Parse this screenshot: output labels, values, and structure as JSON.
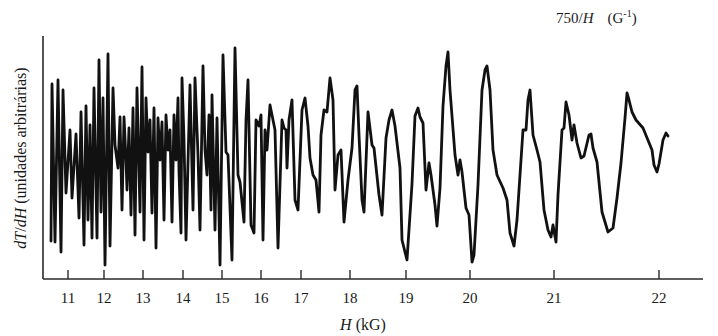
{
  "chart_data": {
    "type": "line",
    "title": "",
    "top_axis_label": {
      "prefix": "750/",
      "var": "H",
      "units": "(G",
      "sup": "-1",
      "close": ")"
    },
    "xlabel": {
      "var": "H",
      "units": " (kG)"
    },
    "ylabel": {
      "num": "dT",
      "slash": "/",
      "den": "dH",
      "units": " (unidades arbitrárias)"
    },
    "x_scale": "linear in 750/H (inverse field)",
    "xlim": [
      10.6,
      22.6
    ],
    "ylim": "arbitrary units",
    "grid": false,
    "legend": "none",
    "x_ticks": [
      {
        "label": "11",
        "px": 68
      },
      {
        "label": "12",
        "px": 104
      },
      {
        "label": "13",
        "px": 143
      },
      {
        "label": "14",
        "px": 183
      },
      {
        "label": "15",
        "px": 222
      },
      {
        "label": "16",
        "px": 261
      },
      {
        "label": "17",
        "px": 301
      },
      {
        "label": "18",
        "px": 350
      },
      {
        "label": "19",
        "px": 406
      },
      {
        "label": "20",
        "px": 470
      },
      {
        "label": "21",
        "px": 554
      },
      {
        "label": "22",
        "px": 659
      }
    ],
    "series": [
      {
        "name": "dT/dH oscillation trace",
        "description": "de Haas–van Alphen-type quantum oscillations; amplitude grows and period widens with H",
        "points_px": [
          [
            51,
            241
          ],
          [
            52,
            84
          ],
          [
            55,
            242
          ],
          [
            58,
            80
          ],
          [
            61,
            252
          ],
          [
            63,
            90
          ],
          [
            66,
            193
          ],
          [
            70,
            130
          ],
          [
            72,
            198
          ],
          [
            76,
            134
          ],
          [
            79,
            218
          ],
          [
            81,
            112
          ],
          [
            84,
            245
          ],
          [
            86,
            106
          ],
          [
            88,
            220
          ],
          [
            90,
            125
          ],
          [
            92,
            238
          ],
          [
            94,
            88
          ],
          [
            97,
            238
          ],
          [
            99,
            60
          ],
          [
            101,
            212
          ],
          [
            103,
            98
          ],
          [
            105,
            265
          ],
          [
            108,
            54
          ],
          [
            110,
            246
          ],
          [
            113,
            88
          ],
          [
            115,
            145
          ],
          [
            118,
            168
          ],
          [
            120,
            117
          ],
          [
            122,
            210
          ],
          [
            124,
            117
          ],
          [
            126,
            160
          ],
          [
            127,
            190
          ],
          [
            129,
            128
          ],
          [
            131,
            215
          ],
          [
            133,
            108
          ],
          [
            135,
            235
          ],
          [
            137,
            88
          ],
          [
            140,
            212
          ],
          [
            142,
            67
          ],
          [
            144,
            240
          ],
          [
            146,
            98
          ],
          [
            148,
            152
          ],
          [
            150,
            120
          ],
          [
            152,
            213
          ],
          [
            154,
            108
          ],
          [
            156,
            248
          ],
          [
            158,
            118
          ],
          [
            160,
            160
          ],
          [
            162,
            122
          ],
          [
            164,
            220
          ],
          [
            166,
            115
          ],
          [
            168,
            150
          ],
          [
            170,
            130
          ],
          [
            172,
            222
          ],
          [
            174,
            115
          ],
          [
            176,
            160
          ],
          [
            178,
            98
          ],
          [
            179,
            172
          ],
          [
            181,
            233
          ],
          [
            182,
            78
          ],
          [
            184,
            140
          ],
          [
            186,
            240
          ],
          [
            190,
            85
          ],
          [
            193,
            210
          ],
          [
            195,
            78
          ],
          [
            198,
            155
          ],
          [
            200,
            230
          ],
          [
            203,
            66
          ],
          [
            205,
            150
          ],
          [
            207,
            175
          ],
          [
            209,
            115
          ],
          [
            211,
            210
          ],
          [
            212,
            95
          ],
          [
            215,
            230
          ],
          [
            217,
            118
          ],
          [
            220,
            265
          ],
          [
            223,
            55
          ],
          [
            226,
            152
          ],
          [
            228,
            155
          ],
          [
            232,
            260
          ],
          [
            235,
            48
          ],
          [
            238,
            175
          ],
          [
            240,
            182
          ],
          [
            244,
            222
          ],
          [
            246,
            120
          ],
          [
            248,
            80
          ],
          [
            251,
            225
          ],
          [
            254,
            233
          ],
          [
            256,
            120
          ],
          [
            259,
            126
          ],
          [
            261,
            115
          ],
          [
            263,
            240
          ],
          [
            265,
            130
          ],
          [
            267,
            150
          ],
          [
            270,
            105
          ],
          [
            275,
            130
          ],
          [
            278,
            248
          ],
          [
            282,
            120
          ],
          [
            284,
            128
          ],
          [
            286,
            130
          ],
          [
            287,
            168
          ],
          [
            289,
            120
          ],
          [
            292,
            100
          ],
          [
            295,
            200
          ],
          [
            298,
            210
          ],
          [
            301,
            135
          ],
          [
            302,
            110
          ],
          [
            305,
            98
          ],
          [
            308,
            126
          ],
          [
            310,
            158
          ],
          [
            313,
            175
          ],
          [
            316,
            180
          ],
          [
            319,
            212
          ],
          [
            321,
            135
          ],
          [
            324,
            110
          ],
          [
            327,
            112
          ],
          [
            330,
            78
          ],
          [
            333,
            100
          ],
          [
            335,
            190
          ],
          [
            338,
            155
          ],
          [
            341,
            150
          ],
          [
            344,
            222
          ],
          [
            348,
            180
          ],
          [
            352,
            148
          ],
          [
            355,
            90
          ],
          [
            357,
            86
          ],
          [
            359,
            135
          ],
          [
            362,
            200
          ],
          [
            364,
            212
          ],
          [
            368,
            112
          ],
          [
            372,
            145
          ],
          [
            374,
            148
          ],
          [
            379,
            195
          ],
          [
            382,
            215
          ],
          [
            386,
            138
          ],
          [
            389,
            120
          ],
          [
            392,
            110
          ],
          [
            395,
            126
          ],
          [
            400,
            168
          ],
          [
            402,
            240
          ],
          [
            407,
            260
          ],
          [
            412,
            184
          ],
          [
            415,
            116
          ],
          [
            418,
            108
          ],
          [
            420,
            117
          ],
          [
            423,
            123
          ],
          [
            426,
            190
          ],
          [
            429,
            163
          ],
          [
            431,
            175
          ],
          [
            435,
            205
          ],
          [
            437,
            226
          ],
          [
            440,
            188
          ],
          [
            443,
            106
          ],
          [
            446,
            66
          ],
          [
            448,
            52
          ],
          [
            450,
            90
          ],
          [
            455,
            155
          ],
          [
            458,
            175
          ],
          [
            460,
            160
          ],
          [
            462,
            172
          ],
          [
            466,
            208
          ],
          [
            469,
            215
          ],
          [
            472,
            262
          ],
          [
            474,
            255
          ],
          [
            478,
            185
          ],
          [
            482,
            90
          ],
          [
            485,
            70
          ],
          [
            487,
            66
          ],
          [
            490,
            90
          ],
          [
            493,
            150
          ],
          [
            497,
            175
          ],
          [
            503,
            188
          ],
          [
            507,
            200
          ],
          [
            510,
            233
          ],
          [
            514,
            246
          ],
          [
            517,
            220
          ],
          [
            520,
            175
          ],
          [
            523,
            130
          ],
          [
            526,
            130
          ],
          [
            528,
            100
          ],
          [
            530,
            90
          ],
          [
            533,
            135
          ],
          [
            537,
            150
          ],
          [
            540,
            162
          ],
          [
            544,
            210
          ],
          [
            548,
            230
          ],
          [
            551,
            237
          ],
          [
            553,
            225
          ],
          [
            556,
            242
          ],
          [
            558,
            195
          ],
          [
            562,
            130
          ],
          [
            564,
            128
          ],
          [
            566,
            102
          ],
          [
            569,
            115
          ],
          [
            572,
            140
          ],
          [
            574,
            125
          ],
          [
            577,
            143
          ],
          [
            581,
            158
          ],
          [
            584,
            156
          ],
          [
            589,
            135
          ],
          [
            591,
            134
          ],
          [
            593,
            148
          ],
          [
            597,
            162
          ],
          [
            602,
            212
          ],
          [
            608,
            232
          ],
          [
            613,
            228
          ],
          [
            617,
            198
          ],
          [
            621,
            163
          ],
          [
            625,
            118
          ],
          [
            627,
            93
          ],
          [
            629,
            100
          ],
          [
            632,
            112
          ],
          [
            636,
            120
          ],
          [
            643,
            128
          ],
          [
            652,
            150
          ],
          [
            654,
            165
          ],
          [
            657,
            172
          ],
          [
            659,
            164
          ],
          [
            663,
            140
          ],
          [
            666,
            133
          ],
          [
            668,
            136
          ]
        ]
      }
    ]
  }
}
